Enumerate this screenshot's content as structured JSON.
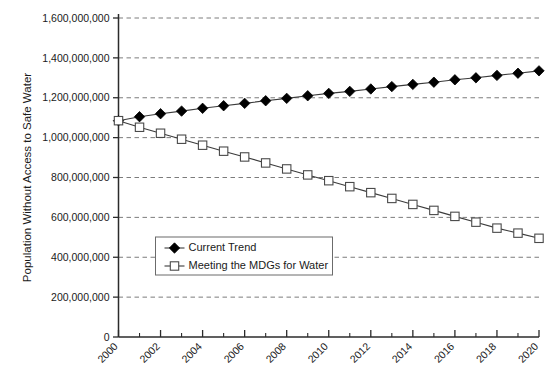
{
  "chart_data": {
    "type": "line",
    "title": "",
    "xlabel": "",
    "ylabel": "Population Without Access to Safe Water",
    "x": [
      2000,
      2001,
      2002,
      2003,
      2004,
      2005,
      2006,
      2007,
      2008,
      2009,
      2010,
      2011,
      2012,
      2013,
      2014,
      2015,
      2016,
      2017,
      2018,
      2019,
      2020
    ],
    "xlim": [
      2000,
      2020
    ],
    "ylim": [
      0,
      1600000000
    ],
    "ytick_values": [
      0,
      200000000,
      400000000,
      600000000,
      800000000,
      1000000000,
      1200000000,
      1400000000,
      1600000000
    ],
    "ytick_labels": [
      "0",
      "200,000,000",
      "400,000,000",
      "600,000,000",
      "800,000,000",
      "1,000,000,000",
      "1,200,000,000",
      "1,400,000,000",
      "1,600,000,000"
    ],
    "xtick_labels": [
      "2000",
      "2002",
      "2004",
      "2006",
      "2008",
      "2010",
      "2012",
      "2014",
      "2016",
      "2018",
      "2020"
    ],
    "xtick_major_values": [
      2000,
      2002,
      2004,
      2006,
      2008,
      2010,
      2012,
      2014,
      2016,
      2018,
      2020
    ],
    "xtick_minor_values": [
      2001,
      2003,
      2005,
      2007,
      2009,
      2011,
      2013,
      2015,
      2017,
      2019
    ],
    "grid": true,
    "grid_axis": "y",
    "legend_position": "center-left",
    "series": [
      {
        "name": "Current Trend",
        "marker": "filled-diamond",
        "color": "#000000",
        "values": [
          1085000000,
          1105000000,
          1120000000,
          1133000000,
          1147000000,
          1160000000,
          1172000000,
          1185000000,
          1197000000,
          1210000000,
          1222000000,
          1232000000,
          1244000000,
          1256000000,
          1267000000,
          1278000000,
          1290000000,
          1300000000,
          1312000000,
          1323000000,
          1335000000
        ]
      },
      {
        "name": "Meeting the MDGs for Water",
        "marker": "open-square",
        "color": "#ffffff",
        "values": [
          1085000000,
          1052000000,
          1022000000,
          992000000,
          962000000,
          932000000,
          903000000,
          873000000,
          843000000,
          813000000,
          784000000,
          754000000,
          724000000,
          695000000,
          665000000,
          635000000,
          605000000,
          576000000,
          546000000,
          521000000,
          495000000
        ]
      }
    ]
  },
  "legend": {
    "items": [
      {
        "label": "Current Trend"
      },
      {
        "label": "Meeting the MDGs for Water"
      }
    ]
  }
}
